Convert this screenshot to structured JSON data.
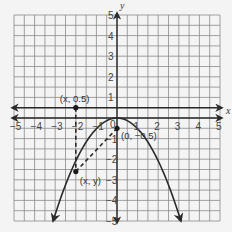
{
  "figure": {
    "type": "coordinate-plane",
    "x_axis_label": "x",
    "y_axis_label": "y",
    "x_range": [
      -5,
      5
    ],
    "y_range": [
      -5,
      5
    ],
    "x_ticks": [
      "−5",
      "−4",
      "−3",
      "−2",
      "−1",
      "0",
      "1",
      "2",
      "3",
      "4",
      "5"
    ],
    "y_ticks": [
      "5",
      "4",
      "3",
      "2",
      "1",
      "−1",
      "−2",
      "−3",
      "−4",
      "−5"
    ],
    "origin_label": "0",
    "directrix": {
      "equation": "y = 0.5",
      "y": 0.5
    },
    "parabola": {
      "equation": "y = -0.5x^2",
      "a": -0.52,
      "vertex": [
        0,
        0
      ]
    },
    "points": [
      {
        "label": "(x, 0.5)",
        "x": -2.0,
        "y": 0.5
      },
      {
        "label": "(0, −0.5)",
        "x": 0,
        "y": -0.5
      },
      {
        "label": "(x, y)",
        "x": -2.0,
        "y": -2.6
      }
    ],
    "segments": [
      {
        "from": "(x, 0.5)",
        "to": "(x, y)",
        "style": "dashed"
      },
      {
        "from": "(x, y)",
        "to": "(0, −0.5)",
        "style": "dashed"
      }
    ],
    "colors": {
      "grid": "#8a8a8a",
      "line": "#2a2a2a",
      "background": "#f4f4f4"
    }
  },
  "chart_data": {
    "type": "line",
    "title": "",
    "xlabel": "x",
    "ylabel": "y",
    "xlim": [
      -5,
      5
    ],
    "ylim": [
      -5,
      5
    ],
    "grid": true,
    "series": [
      {
        "name": "parabola y = -0.5x^2",
        "x": [
          -3.1,
          -3,
          -2,
          -1,
          0,
          1,
          2,
          3,
          3.1
        ],
        "y": [
          -5,
          -4.7,
          -2.1,
          -0.5,
          0,
          -0.5,
          -2.1,
          -4.7,
          -5
        ]
      },
      {
        "name": "directrix y = 0.5",
        "x": [
          -5,
          5
        ],
        "y": [
          0.5,
          0.5
        ]
      }
    ],
    "annotations": [
      "(x, 0.5)",
      "(0, −0.5)",
      "(x, y)"
    ]
  }
}
